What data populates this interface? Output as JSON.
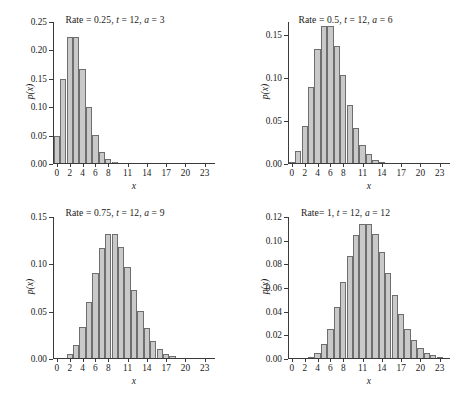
{
  "figure": {
    "clipped_top_text": "",
    "xlabel": "x",
    "ylabel": "p(x)"
  },
  "chart_data": [
    {
      "type": "bar",
      "title": "Rate = 0.25, t = 12, a = 3",
      "title_parts": {
        "rate_label": "Rate = 0.25,",
        "t_label": "t",
        "t_value": " = 12,",
        "a_label": "a",
        "a_value": " = 3"
      },
      "xlabel": "x",
      "ylabel": "p(x)",
      "xlim": [
        -0.6,
        24.6
      ],
      "ylim": [
        0,
        0.25
      ],
      "grid": false,
      "legend": null,
      "xticks": [
        0,
        2,
        4,
        6,
        8,
        11,
        14,
        17,
        20,
        23
      ],
      "xtick_labels": [
        "0",
        "2",
        "4",
        "6",
        "8",
        "11",
        "14",
        "17",
        "20",
        "23"
      ],
      "yticks": [
        0.0,
        0.05,
        0.1,
        0.15,
        0.2,
        0.25
      ],
      "ytick_labels": [
        "0.00",
        "0.05",
        "0.10",
        "0.15",
        "0.20",
        "0.25"
      ],
      "categories": [
        0,
        1,
        2,
        3,
        4,
        5,
        6,
        7,
        8,
        9,
        10,
        11,
        12,
        13,
        14,
        15,
        16,
        17,
        18,
        19,
        20,
        21,
        22,
        23,
        24
      ],
      "values": [
        0.0498,
        0.1494,
        0.224,
        0.224,
        0.168,
        0.1008,
        0.0504,
        0.0216,
        0.0081,
        0.0027,
        0.0008,
        0.0002,
        0.0001,
        0.0,
        0.0,
        0.0,
        0.0,
        0.0,
        0.0,
        0.0,
        0.0,
        0.0,
        0.0,
        0.0,
        0.0
      ]
    },
    {
      "type": "bar",
      "title": "Rate = 0.5, t = 12, a = 6",
      "title_parts": {
        "rate_label": "Rate = 0.5,",
        "t_label": "t",
        "t_value": " = 12,",
        "a_label": "a",
        "a_value": " = 6"
      },
      "xlabel": "x",
      "ylabel": "p(x)",
      "xlim": [
        -0.6,
        24.6
      ],
      "ylim": [
        0,
        0.165
      ],
      "grid": false,
      "legend": null,
      "xticks": [
        0,
        2,
        4,
        6,
        8,
        11,
        14,
        17,
        20,
        23
      ],
      "xtick_labels": [
        "0",
        "2",
        "4",
        "6",
        "8",
        "11",
        "14",
        "17",
        "20",
        "23"
      ],
      "yticks": [
        0.0,
        0.05,
        0.1,
        0.15
      ],
      "ytick_labels": [
        "0.00",
        "0.05",
        "0.10",
        "0.15"
      ],
      "categories": [
        0,
        1,
        2,
        3,
        4,
        5,
        6,
        7,
        8,
        9,
        10,
        11,
        12,
        13,
        14,
        15,
        16,
        17,
        18,
        19,
        20,
        21,
        22,
        23,
        24
      ],
      "values": [
        0.0025,
        0.0149,
        0.0446,
        0.0892,
        0.1339,
        0.1606,
        0.1606,
        0.1377,
        0.1033,
        0.0688,
        0.0413,
        0.0225,
        0.0113,
        0.0052,
        0.0022,
        0.0009,
        0.0003,
        0.0001,
        0.0,
        0.0,
        0.0,
        0.0,
        0.0,
        0.0,
        0.0
      ]
    },
    {
      "type": "bar",
      "title": "Rate = 0.75, t = 12, a = 9",
      "title_parts": {
        "rate_label": "Rate = 0.75,",
        "t_label": "t",
        "t_value": " = 12,",
        "a_label": "a",
        "a_value": " = 9"
      },
      "xlabel": "x",
      "ylabel": "p(x)",
      "xlim": [
        -0.6,
        24.6
      ],
      "ylim": [
        0,
        0.15
      ],
      "grid": false,
      "legend": null,
      "xticks": [
        0,
        2,
        4,
        6,
        8,
        11,
        14,
        17,
        20,
        23
      ],
      "xtick_labels": [
        "0",
        "2",
        "4",
        "6",
        "8",
        "11",
        "14",
        "17",
        "20",
        "23"
      ],
      "yticks": [
        0.0,
        0.05,
        0.1,
        0.15
      ],
      "ytick_labels": [
        "0.00",
        "0.05",
        "0.10",
        "0.15"
      ],
      "categories": [
        0,
        1,
        2,
        3,
        4,
        5,
        6,
        7,
        8,
        9,
        10,
        11,
        12,
        13,
        14,
        15,
        16,
        17,
        18,
        19,
        20,
        21,
        22,
        23,
        24
      ],
      "values": [
        0.0001,
        0.0011,
        0.005,
        0.015,
        0.0337,
        0.0607,
        0.0911,
        0.1171,
        0.1318,
        0.1318,
        0.1186,
        0.097,
        0.0728,
        0.0504,
        0.0324,
        0.0194,
        0.0109,
        0.0058,
        0.0029,
        0.0014,
        0.0006,
        0.0003,
        0.0001,
        0.0,
        0.0
      ]
    },
    {
      "type": "bar",
      "title": "Rate= 1, t = 12, a = 12",
      "title_parts": {
        "rate_label": "Rate= 1,",
        "t_label": "t",
        "t_value": " = 12,",
        "a_label": "a",
        "a_value": " = 12"
      },
      "xlabel": "x",
      "ylabel": "p(x)",
      "xlim": [
        -0.6,
        24.6
      ],
      "ylim": [
        0,
        0.12
      ],
      "grid": false,
      "legend": null,
      "xticks": [
        0,
        2,
        4,
        6,
        8,
        11,
        14,
        17,
        20,
        23
      ],
      "xtick_labels": [
        "0",
        "2",
        "4",
        "6",
        "8",
        "11",
        "14",
        "17",
        "20",
        "23"
      ],
      "yticks": [
        0.0,
        0.02,
        0.04,
        0.06,
        0.08,
        0.1,
        0.12
      ],
      "ytick_labels": [
        "0.00",
        "0.02",
        "0.04",
        "0.06",
        "0.08",
        "0.10",
        "0.12"
      ],
      "categories": [
        0,
        1,
        2,
        3,
        4,
        5,
        6,
        7,
        8,
        9,
        10,
        11,
        12,
        13,
        14,
        15,
        16,
        17,
        18,
        19,
        20,
        21,
        22,
        23,
        24
      ],
      "values": [
        0.0,
        0.0001,
        0.0004,
        0.0018,
        0.0053,
        0.0127,
        0.0255,
        0.0437,
        0.0655,
        0.0874,
        0.1048,
        0.1144,
        0.1144,
        0.1056,
        0.0905,
        0.0724,
        0.0543,
        0.0383,
        0.0256,
        0.0161,
        0.0097,
        0.0055,
        0.003,
        0.0016,
        0.0008
      ]
    }
  ],
  "style": {
    "bar_fill": "#c9c9c9",
    "bar_edge": "#6e6e6e",
    "axis_color": "#3a3a3a",
    "text_color": "#1a1a1a",
    "background": "#ffffff"
  }
}
